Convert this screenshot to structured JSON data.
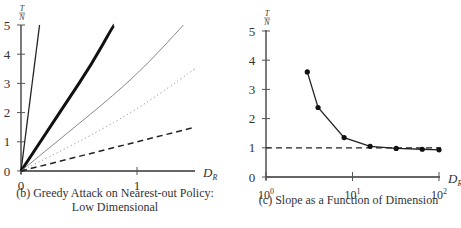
{
  "chart_data": [
    {
      "type": "line",
      "title": "(b) Greedy Attack on Nearest-out Policy: Low Dimensional",
      "caption_lines": [
        "(b) Greedy Attack on Nearest-out Policy:",
        "Low Dimensional"
      ],
      "xlabel": "D_R",
      "ylabel": "T/N",
      "xlim": [
        0,
        1.5
      ],
      "ylim": [
        0,
        5
      ],
      "xticks": [
        "0",
        "1"
      ],
      "yticks": [
        "0",
        "1",
        "2",
        "3",
        "4",
        "5"
      ],
      "grid": false,
      "series": [
        {
          "name": "steep solid",
          "style": "solid-thin-dark",
          "x": [
            0,
            0.16
          ],
          "y": [
            0,
            5
          ]
        },
        {
          "name": "thick solid",
          "style": "solid-thick",
          "x": [
            0,
            0.2,
            0.4,
            0.6,
            0.8
          ],
          "y": [
            0,
            1.2,
            2.4,
            3.6,
            5
          ]
        },
        {
          "name": "gray solid",
          "style": "solid-gray",
          "x": [
            0,
            0.4,
            0.8,
            1.1,
            1.4
          ],
          "y": [
            0,
            1.3,
            2.6,
            3.7,
            5
          ]
        },
        {
          "name": "dotted",
          "style": "dotted",
          "x": [
            0,
            0.5,
            1.0,
            1.5
          ],
          "y": [
            0,
            1.0,
            2.1,
            3.5
          ]
        },
        {
          "name": "dashed",
          "style": "dashed",
          "x": [
            0,
            1.5
          ],
          "y": [
            0,
            1.5
          ]
        }
      ]
    },
    {
      "type": "line",
      "title": "(c) Slope as a Function of Dimension",
      "caption_lines": [
        "(c) Slope as a Function of Dimension"
      ],
      "xlabel": "D_R",
      "ylabel": "T/N",
      "xscale": "log",
      "xlim": [
        1,
        100
      ],
      "ylim": [
        0,
        5
      ],
      "xticks": [
        "10^0",
        "10^1",
        "10^2"
      ],
      "yticks": [
        "0",
        "1",
        "2",
        "3",
        "4",
        "5"
      ],
      "grid": false,
      "series": [
        {
          "name": "slope",
          "style": "solid-markers",
          "x": [
            3,
            4,
            8,
            16,
            32,
            64,
            100
          ],
          "y": [
            3.6,
            2.38,
            1.35,
            1.05,
            0.98,
            0.95,
            0.93
          ]
        },
        {
          "name": "reference y=1",
          "style": "dashed",
          "x": [
            1,
            100
          ],
          "y": [
            1,
            1
          ]
        }
      ]
    }
  ],
  "labels": {
    "ylabel_num": "T",
    "ylabel_den": "N",
    "xlabel_main": "D",
    "xlabel_sub": "R"
  }
}
